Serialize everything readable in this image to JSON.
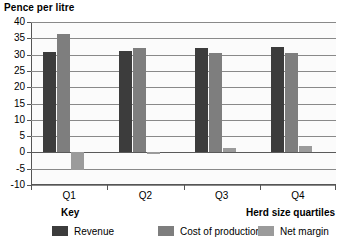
{
  "chart_data": {
    "type": "bar",
    "title": "Pence per litre",
    "xlabel": "Herd size quartiles",
    "ylabel": "Pence per litre",
    "key_caption": "Key",
    "categories": [
      "Q1",
      "Q2",
      "Q3",
      "Q4"
    ],
    "series": [
      {
        "name": "Revenue",
        "color": "#3c3c3c",
        "values": [
          30.7,
          31.1,
          32.0,
          32.2
        ]
      },
      {
        "name": "Cost of production",
        "color": "#7e7e7e",
        "values": [
          36.3,
          31.9,
          30.6,
          30.5
        ]
      },
      {
        "name": "Net margin",
        "color": "#9b9b9b",
        "values": [
          -5.4,
          -0.5,
          1.2,
          2.1
        ]
      }
    ],
    "ylim": [
      -10,
      40
    ],
    "ytick_labels": [
      "40",
      "35",
      "30",
      "25",
      "20",
      "15",
      "10",
      "5",
      "0",
      "-5",
      "-10"
    ],
    "ytick_values": [
      40,
      35,
      30,
      25,
      20,
      15,
      10,
      5,
      0,
      -5,
      -10
    ],
    "grid": true,
    "legend_position": "bottom"
  }
}
